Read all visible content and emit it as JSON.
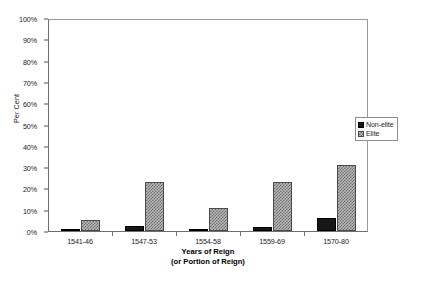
{
  "chart_data": {
    "type": "bar",
    "title": "",
    "xlabel": "Years of Reign",
    "xlabel_line2": "(or Portion of Reign)",
    "ylabel": "Per Cent",
    "ylim": [
      0,
      100
    ],
    "ytick_labels": [
      "100%",
      "90%",
      "80%",
      "70%",
      "60%",
      "50%",
      "40%",
      "30%",
      "20%",
      "10%",
      "0%"
    ],
    "ytick_values": [
      100,
      90,
      80,
      70,
      60,
      50,
      40,
      30,
      20,
      10,
      0
    ],
    "grid": false,
    "legend_position": "right",
    "categories": [
      "1541-46",
      "1547-53",
      "1554-58",
      "1559-69",
      "1570-80"
    ],
    "series": [
      {
        "name": "Non-elite",
        "color": "#171717",
        "fill": "solid",
        "values": [
          0.5,
          2.5,
          0.7,
          2.0,
          6.0
        ]
      },
      {
        "name": "Elite",
        "color": "#b9b9b9",
        "fill": "checkered",
        "values": [
          5.0,
          23.0,
          11.0,
          23.0,
          31.0
        ]
      }
    ]
  },
  "legend": {
    "items": [
      {
        "label": "Non-elite"
      },
      {
        "label": "Elite"
      }
    ]
  }
}
